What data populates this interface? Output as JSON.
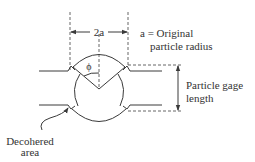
{
  "diagram": {
    "type": "particle-neck-schematic",
    "labels": {
      "width_dimension": "2a",
      "radius_definition_line1": "a = Original",
      "radius_definition_line2": "particle radius",
      "angle_symbol": "ϕ",
      "gage_length_line1": "Particle gage",
      "gage_length_line2": "length",
      "decohered_line1": "Decohered",
      "decohered_line2": "area"
    },
    "colors": {
      "line": "#3a3a3a",
      "dashed": "#555555",
      "text": "#333333",
      "background": "#ffffff"
    }
  }
}
